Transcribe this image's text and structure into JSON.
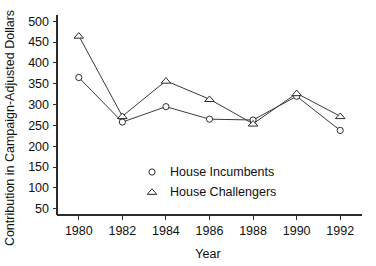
{
  "chart_data": {
    "type": "line",
    "title": "",
    "xlabel": "Year",
    "ylabel": "Contribution in Campaign-Adjusted Dollars",
    "categories": [
      "1980",
      "1982",
      "1984",
      "1986",
      "1988",
      "1990",
      "1992"
    ],
    "x": [
      1980,
      1982,
      1984,
      1986,
      1988,
      1990,
      1992
    ],
    "xlim": [
      1979,
      1993
    ],
    "ylim": [
      35,
      515
    ],
    "grid": false,
    "legend_position": "center",
    "yticks": [
      50,
      100,
      150,
      200,
      250,
      300,
      350,
      400,
      450,
      500
    ],
    "ytick_labels": [
      "50",
      "100",
      "150",
      "200",
      "250",
      "300",
      "350",
      "400",
      "450",
      "500"
    ],
    "xticks": [
      1980,
      1982,
      1984,
      1986,
      1988,
      1990,
      1992
    ],
    "xtick_labels": [
      "1980",
      "1982",
      "1984",
      "1986",
      "1988",
      "1990",
      "1992"
    ],
    "series": [
      {
        "name": "House Incumbents",
        "marker": "circle",
        "values": [
          365,
          258,
          295,
          265,
          263,
          320,
          238
        ]
      },
      {
        "name": "House Challengers",
        "marker": "triangle",
        "values": [
          465,
          272,
          357,
          313,
          254,
          327,
          272
        ]
      }
    ]
  },
  "legend": {
    "items": [
      {
        "label": "House Incumbents",
        "marker": "circle"
      },
      {
        "label": "House Challengers",
        "marker": "triangle"
      }
    ]
  },
  "colors": {
    "axis": "#2b2b2b",
    "line": "#3a3a3a",
    "marker_fill": "#ffffff",
    "text": "#101010",
    "background": "#ffffff"
  }
}
